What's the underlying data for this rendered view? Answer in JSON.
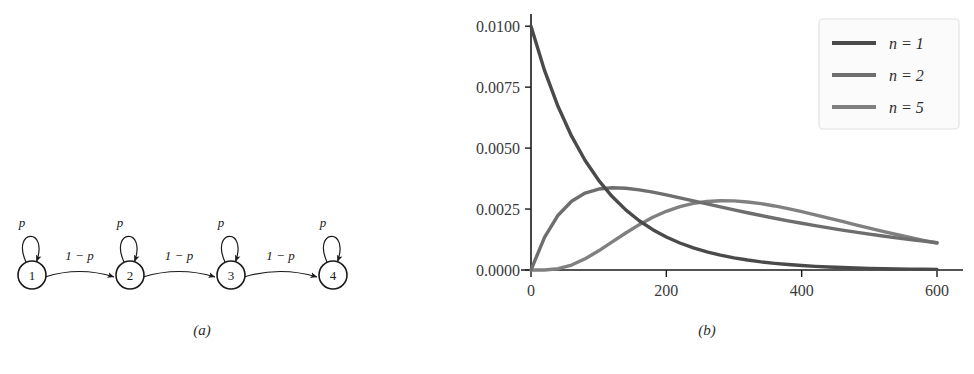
{
  "figure": {
    "panel_a": {
      "caption": "(a)",
      "type": "markov-chain-diagram",
      "nodes": [
        {
          "label": "1",
          "cx": 32,
          "cy": 275
        },
        {
          "label": "2",
          "cx": 130,
          "cy": 275
        },
        {
          "label": "3",
          "cx": 231,
          "cy": 275
        },
        {
          "label": "4",
          "cx": 333,
          "cy": 275
        }
      ],
      "node_radius": 14,
      "self_loop_label": "p",
      "transition_label": "1 − p",
      "transitions": [
        {
          "from": "1",
          "to": "2",
          "label": "1 − p"
        },
        {
          "from": "2",
          "to": "3",
          "label": "1 − p"
        },
        {
          "from": "3",
          "to": "4",
          "label": "1 − p"
        }
      ],
      "self_loops": [
        {
          "node": "1",
          "label": "p"
        },
        {
          "node": "2",
          "label": "p"
        },
        {
          "node": "3",
          "label": "p"
        },
        {
          "node": "4",
          "label": "p"
        }
      ]
    },
    "panel_b": {
      "caption": "(b)"
    }
  },
  "chart_data": {
    "type": "line",
    "title": "",
    "xlabel": "",
    "ylabel": "",
    "xlim": [
      0,
      600
    ],
    "ylim": [
      0.0,
      0.0105
    ],
    "xticks": [
      0,
      200,
      400,
      600
    ],
    "xtick_labels": [
      "0",
      "200",
      "400",
      "600"
    ],
    "yticks": [
      0.0,
      0.0025,
      0.005,
      0.0075,
      0.01
    ],
    "ytick_labels": [
      "0.0000",
      "0.0025",
      "0.0050",
      "0.0075",
      "0.0100"
    ],
    "grid": false,
    "legend_position": "upper right",
    "series": [
      {
        "name": "n = 1",
        "color": "#4a4a4a",
        "x": [
          0,
          20,
          40,
          60,
          80,
          100,
          120,
          140,
          160,
          180,
          200,
          220,
          240,
          260,
          280,
          300,
          320,
          340,
          360,
          380,
          400,
          420,
          440,
          460,
          480,
          500,
          520,
          540,
          560,
          580,
          600
        ],
        "y": [
          0.01,
          0.008187,
          0.006703,
          0.005488,
          0.004493,
          0.003679,
          0.003012,
          0.002466,
          0.002019,
          0.001653,
          0.001353,
          0.001108,
          0.000907,
          0.000743,
          0.000608,
          0.000498,
          0.000408,
          0.000334,
          0.000273,
          0.000224,
          0.000183,
          0.00015,
          0.000123,
          0.0001,
          8.22e-05,
          6.74e-05,
          5.51e-05,
          4.52e-05,
          3.7e-05,
          3.03e-05,
          2.48e-05
        ]
      },
      {
        "name": "n = 2",
        "color": "#6e6e6e",
        "x": [
          0,
          20,
          40,
          60,
          80,
          100,
          120,
          140,
          160,
          180,
          200,
          220,
          240,
          260,
          280,
          300,
          320,
          340,
          360,
          380,
          400,
          420,
          440,
          460,
          480,
          500,
          520,
          540,
          560,
          580,
          600
        ],
        "y": [
          0.0,
          0.001341,
          0.002247,
          0.002822,
          0.003155,
          0.003321,
          0.003374,
          0.003354,
          0.003288,
          0.003193,
          0.003081,
          0.002961,
          0.002836,
          0.002711,
          0.002587,
          0.002466,
          0.002348,
          0.002234,
          0.002124,
          0.002018,
          0.001916,
          0.001819,
          0.001726,
          0.001637,
          0.001552,
          0.001471,
          0.001394,
          0.00132,
          0.00125,
          0.001183,
          0.001119
        ]
      },
      {
        "name": "n = 5",
        "color": "#808080",
        "x": [
          0,
          20,
          40,
          60,
          80,
          100,
          120,
          140,
          160,
          180,
          200,
          220,
          240,
          260,
          280,
          300,
          320,
          340,
          360,
          380,
          400,
          420,
          440,
          460,
          480,
          500,
          520,
          540,
          560,
          580,
          600
        ],
        "y": [
          0.0,
          2.3e-06,
          5.21e-05,
          0.000203,
          0.000458,
          0.000787,
          0.001152,
          0.001519,
          0.001861,
          0.002161,
          0.002408,
          0.002598,
          0.002731,
          0.002811,
          0.002843,
          0.002834,
          0.002791,
          0.00272,
          0.002627,
          0.002517,
          0.002395,
          0.002264,
          0.002128,
          0.001991,
          0.001853,
          0.001717,
          0.001585,
          0.001457,
          0.001334,
          0.001217,
          0.001106
        ]
      }
    ],
    "legend_entries": [
      {
        "label": "n = 1",
        "color": "#4a4a4a"
      },
      {
        "label": "n = 2",
        "color": "#6e6e6e"
      },
      {
        "label": "n = 5",
        "color": "#808080"
      }
    ]
  }
}
